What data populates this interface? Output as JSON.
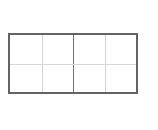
{
  "canvas": {
    "width": 158,
    "height": 130,
    "background_color": "#ffffff"
  },
  "diagram": {
    "name": "grid-diagram",
    "title": "",
    "shape": "rectangle-grid",
    "columns": 4,
    "rows": 2,
    "bounds": {
      "x": 8,
      "y": 33,
      "width": 130,
      "height": 61
    },
    "outer_border": {
      "color": "#636363",
      "width_px": 2
    },
    "center_divider": {
      "orientation": "vertical",
      "color": "#707070",
      "width_px": 1,
      "x_fraction": 0.5
    },
    "minor_vertical_dividers": {
      "color": "#d2d2d2",
      "width_px": 1,
      "x_fractions": [
        0.25,
        0.75
      ]
    },
    "horizontal_dividers": {
      "color": "#d8d8d8",
      "width_px": 1,
      "y_fractions": [
        0.5
      ]
    },
    "cells": [
      {
        "id": "r1c1",
        "row": 1,
        "col": 1,
        "label": "",
        "fill": "#ffffff"
      },
      {
        "id": "r1c2",
        "row": 1,
        "col": 2,
        "label": "",
        "fill": "#ffffff"
      },
      {
        "id": "r1c3",
        "row": 1,
        "col": 3,
        "label": "",
        "fill": "#ffffff"
      },
      {
        "id": "r1c4",
        "row": 1,
        "col": 4,
        "label": "",
        "fill": "#ffffff"
      },
      {
        "id": "r2c1",
        "row": 2,
        "col": 1,
        "label": "",
        "fill": "#ffffff"
      },
      {
        "id": "r2c2",
        "row": 2,
        "col": 2,
        "label": "",
        "fill": "#ffffff"
      },
      {
        "id": "r2c3",
        "row": 2,
        "col": 3,
        "label": "",
        "fill": "#ffffff"
      },
      {
        "id": "r2c4",
        "row": 2,
        "col": 4,
        "label": "",
        "fill": "#ffffff"
      }
    ]
  }
}
